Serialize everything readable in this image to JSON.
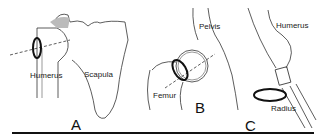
{
  "figure": {
    "panels": [
      {
        "letter": "A",
        "joint": "shoulder",
        "labels": [
          "Humerus",
          "Scapula"
        ]
      },
      {
        "letter": "B",
        "joint": "hip",
        "labels": [
          "Pelvis",
          "Femur"
        ]
      },
      {
        "letter": "C",
        "joint": "elbow",
        "labels": [
          "Humerus",
          "Radius"
        ]
      }
    ],
    "colors": {
      "line": "#222222",
      "shade": "#bbbbbb",
      "background": "#ffffff"
    }
  }
}
